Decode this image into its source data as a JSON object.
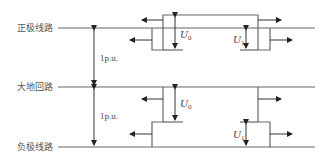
{
  "diagram": {
    "title": "",
    "lines": [
      {
        "id": "positive",
        "label": "正极线路",
        "y": 28
      },
      {
        "id": "ground",
        "label": "大地回路",
        "y": 87
      },
      {
        "id": "negative",
        "label": "负极线路",
        "y": 147
      }
    ],
    "spacing_labels": [
      {
        "between": [
          "positive",
          "ground"
        ],
        "text": "1p.u."
      },
      {
        "between": [
          "ground",
          "negative"
        ],
        "text": "1p.u."
      }
    ],
    "voltage_labels": {
      "u0": {
        "base": "U",
        "sub": "0"
      },
      "u1": {
        "base": "U",
        "sub": "1"
      }
    },
    "colors": {
      "line": "#666666",
      "arrow": "#333333",
      "text": "#555555",
      "background": "#ffffff"
    }
  }
}
